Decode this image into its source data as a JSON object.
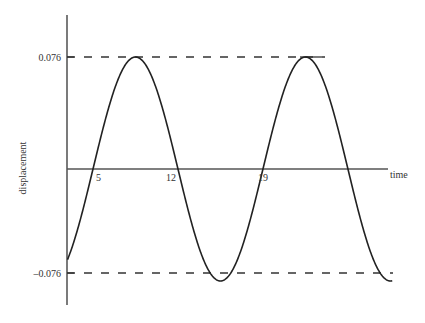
{
  "chart_data": {
    "type": "line",
    "title": "",
    "xlabel": "time",
    "ylabel": "displacement",
    "x_tick_labels": [
      "5",
      "12",
      "19"
    ],
    "y_tick_labels": [
      "0.076",
      "–0.076"
    ],
    "amplitude": 0.076,
    "period": 14,
    "zero_crossings": [
      5,
      12,
      19,
      26
    ],
    "peaks": [
      {
        "x": 8.5,
        "y": 0.076
      },
      {
        "x": 22.5,
        "y": 0.076
      }
    ],
    "troughs": [
      {
        "x": 15.5,
        "y": -0.076
      },
      {
        "x": 29.5,
        "y": -0.076
      }
    ],
    "reference_lines": [
      {
        "y": 0.076,
        "style": "dashed"
      },
      {
        "y": -0.076,
        "style": "dashed"
      }
    ],
    "xlim": [
      2.9,
      29.7
    ],
    "ylim": [
      -0.076,
      0.076
    ],
    "grid": false,
    "legend": null,
    "series": [
      {
        "name": "displacement",
        "x": [
          3,
          5,
          8.5,
          12,
          15.5,
          19,
          22.5,
          26,
          29.5
        ],
        "values": [
          -0.065,
          0,
          0.076,
          0,
          -0.076,
          0,
          0.076,
          0,
          -0.076
        ]
      }
    ],
    "colors": {
      "line": "#222222",
      "axis": "#333333"
    }
  },
  "labels": {
    "y_axis": "displacement",
    "x_axis": "time",
    "y_max": "0.076",
    "y_min": "–0.076",
    "x_ticks": [
      "5",
      "12",
      "19"
    ]
  }
}
